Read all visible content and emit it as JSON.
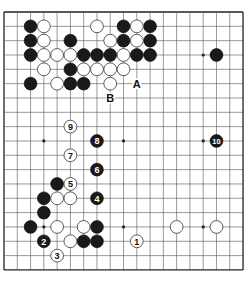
{
  "diagram": {
    "type": "go-board",
    "size": 19,
    "origin": {
      "x": 4,
      "y": 12
    },
    "cell": {
      "w": 13.28,
      "h": 14.33
    },
    "colors": {
      "background": "#ffffff",
      "line": "#555555",
      "edge": "#222222",
      "black": "#1a1a1a",
      "white": "#ffffff"
    },
    "star_points": [
      [
        3,
        3
      ],
      [
        9,
        3
      ],
      [
        15,
        3
      ],
      [
        3,
        9
      ],
      [
        9,
        9
      ],
      [
        15,
        9
      ],
      [
        3,
        15
      ],
      [
        9,
        15
      ],
      [
        15,
        15
      ]
    ],
    "black_stones": [
      [
        2,
        1
      ],
      [
        9,
        1
      ],
      [
        11,
        1
      ],
      [
        2,
        2
      ],
      [
        5,
        2
      ],
      [
        9,
        2
      ],
      [
        11,
        2
      ],
      [
        2,
        3
      ],
      [
        6,
        3
      ],
      [
        7,
        3
      ],
      [
        8,
        3
      ],
      [
        10,
        3
      ],
      [
        11,
        3
      ],
      [
        16,
        3
      ],
      [
        5,
        4
      ],
      [
        2,
        5
      ],
      [
        5,
        5
      ],
      [
        6,
        5
      ],
      [
        4,
        12
      ],
      [
        3,
        13
      ],
      [
        3,
        14
      ],
      [
        2,
        15
      ],
      [
        7,
        15
      ],
      [
        6,
        16
      ],
      [
        7,
        16
      ]
    ],
    "white_stones": [
      [
        3,
        1
      ],
      [
        7,
        1
      ],
      [
        10,
        1
      ],
      [
        3,
        2
      ],
      [
        8,
        2
      ],
      [
        10,
        2
      ],
      [
        3,
        3
      ],
      [
        4,
        3
      ],
      [
        5,
        3
      ],
      [
        9,
        3
      ],
      [
        3,
        4
      ],
      [
        6,
        4
      ],
      [
        7,
        4
      ],
      [
        8,
        4
      ],
      [
        9,
        4
      ],
      [
        4,
        5
      ],
      [
        8,
        5
      ],
      [
        4,
        13
      ],
      [
        5,
        13
      ],
      [
        4,
        15
      ],
      [
        6,
        15
      ],
      [
        5,
        16
      ],
      [
        13,
        15
      ],
      [
        16,
        15
      ]
    ],
    "numbered_moves": [
      {
        "n": "1",
        "color": "white",
        "col": 10,
        "row": 16
      },
      {
        "n": "2",
        "color": "black",
        "col": 3,
        "row": 16
      },
      {
        "n": "3",
        "color": "white",
        "col": 4,
        "row": 17
      },
      {
        "n": "4",
        "color": "black",
        "col": 7,
        "row": 13
      },
      {
        "n": "5",
        "color": "white",
        "col": 5,
        "row": 12
      },
      {
        "n": "6",
        "color": "black",
        "col": 7,
        "row": 11
      },
      {
        "n": "7",
        "color": "white",
        "col": 5,
        "row": 10
      },
      {
        "n": "8",
        "color": "black",
        "col": 7,
        "row": 9
      },
      {
        "n": "9",
        "color": "white",
        "col": 5,
        "row": 8
      },
      {
        "n": "10",
        "color": "black",
        "col": 16,
        "row": 9
      }
    ],
    "letter_labels": [
      {
        "text": "A",
        "col": 10,
        "row": 5
      },
      {
        "text": "B",
        "col": 8,
        "row": 6
      }
    ]
  }
}
